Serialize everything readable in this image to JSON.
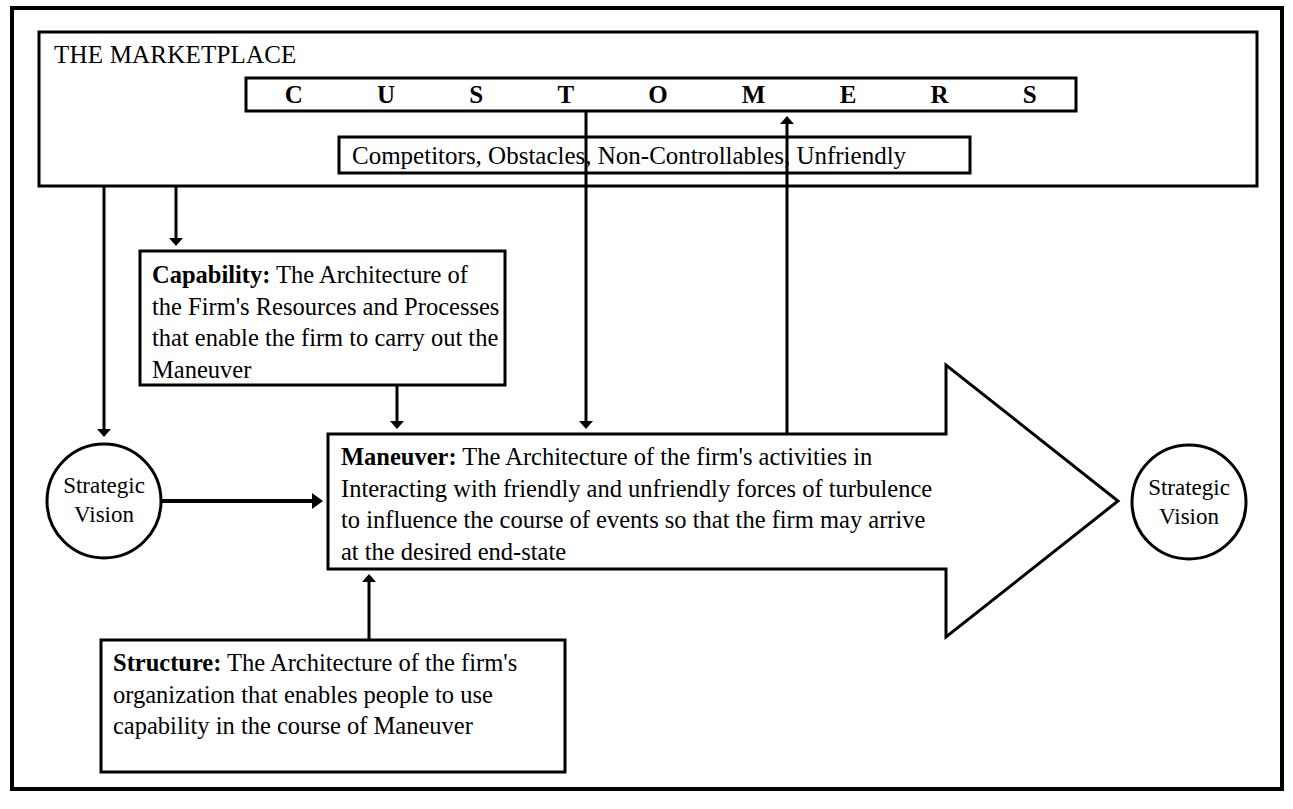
{
  "diagram": {
    "title": "THE MARKETPLACE",
    "marketplace_label": "THE MARKETPLACE",
    "customers_letters": [
      "C",
      "U",
      "S",
      "T",
      "O",
      "M",
      "E",
      "R",
      "S"
    ],
    "customers_word": "CUSTOMERS",
    "competitors_box": "Competitors, Obstacles, Non-Controllables, Unfriendly",
    "capability": {
      "term": "Capability:",
      "body": " The Architecture of the Firm's Resources and Processes that enable the firm to carry out the Maneuver",
      "full": "Capability: The Architecture of the Firm's Resources and Processes that enable the firm to carry out the Maneuver"
    },
    "maneuver": {
      "term": "Maneuver:",
      "body": " The Architecture of the firm's activities in Interacting with friendly and unfriendly forces of turbulence to influence the course of events so that the firm may arrive at the desired end-state",
      "full": "Maneuver: The Architecture of the firm's activities in Interacting with friendly and unfriendly forces of turbulence to influence the course of events so that the firm may arrive at the desired end-state"
    },
    "structure": {
      "term": "Structure:",
      "body": " The Architecture of the firm's organization that enables people to use capability in the course of Maneuver",
      "full": "Structure: The Architecture of the firm's organization that enables people to use capability in the course of Maneuver"
    },
    "strategic_vision_left": {
      "line1": "Strategic",
      "line2": "Vision"
    },
    "strategic_vision_right": {
      "line1": "Strategic",
      "line2": "Vision"
    },
    "colors": {
      "stroke": "#000000",
      "background": "#ffffff",
      "text": "#000000"
    }
  }
}
